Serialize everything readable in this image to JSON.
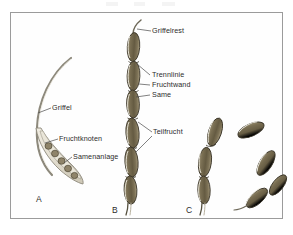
{
  "figure": {
    "background_color": "#ffffff",
    "frame_color": "#9b9b9b",
    "fruit_fill_dark": "#6b6047",
    "fruit_fill_mid": "#7e7357",
    "fruit_fill_light": "#a79c7e",
    "outline_color": "#3a3528",
    "style_color": "#ded9cc",
    "ovule_fill": "#8a7f62",
    "label_color": "#2b2b2b",
    "leader_color": "#4a4a4a"
  },
  "panels": [
    {
      "letter": "A",
      "name": "panel-a-pistil",
      "labels": [
        {
          "key": "griffel",
          "text": "Griffel"
        },
        {
          "key": "fruchtknoten",
          "text": "Fruchtknoten"
        },
        {
          "key": "samenanlage",
          "text": "Samenanlage"
        }
      ],
      "ovule_count": 5
    },
    {
      "letter": "B",
      "name": "panel-b-loment",
      "labels": [
        {
          "key": "griffelrest",
          "text": "Griffelrest"
        },
        {
          "key": "trennlinie",
          "text": "Trennlinie"
        },
        {
          "key": "fruchtwand",
          "text": "Fruchtwand"
        },
        {
          "key": "same",
          "text": "Same"
        },
        {
          "key": "teilfrucht",
          "text": "Teilfrucht"
        }
      ],
      "segment_count": 7
    },
    {
      "letter": "C",
      "name": "panel-c-mericarps",
      "labels": [],
      "chain_segment_count": 3,
      "detached_segment_count": 4
    }
  ],
  "labels_flat": {
    "griffelrest": "Griffelrest",
    "trennlinie": "Trennlinie",
    "fruchtwand": "Fruchtwand",
    "same": "Same",
    "teilfrucht": "Teilfrucht",
    "griffel": "Griffel",
    "fruchtknoten": "Fruchtknoten",
    "samenanlage": "Samenanlage"
  },
  "panel_letters": {
    "a": "A",
    "b": "B",
    "c": "C"
  }
}
